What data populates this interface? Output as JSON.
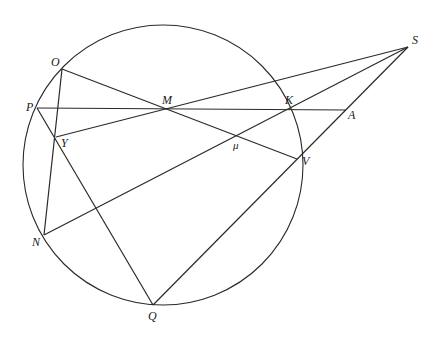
{
  "diagram": {
    "type": "geometry",
    "circle": {
      "cx": 163,
      "cy": 165,
      "r": 140
    },
    "points": {
      "O": [
        62,
        69
      ],
      "P": [
        37,
        108
      ],
      "M": [
        167,
        108
      ],
      "Y": [
        56,
        137
      ],
      "K": [
        287,
        110
      ],
      "A": [
        346,
        110
      ],
      "S": [
        408,
        47
      ],
      "mu": [
        238,
        135
      ],
      "V": [
        297,
        159
      ],
      "N": [
        44,
        235
      ],
      "Q": [
        153,
        305
      ]
    },
    "segments": [
      [
        "O",
        "V"
      ],
      [
        "O",
        "N"
      ],
      [
        "P",
        "A"
      ],
      [
        "P",
        "Q"
      ],
      [
        "Y",
        "S"
      ],
      [
        "N",
        "S"
      ],
      [
        "Q",
        "S"
      ]
    ],
    "labels": {
      "O": "O",
      "P": "P",
      "M": "M",
      "Y": "Y",
      "K": "K",
      "A": "A",
      "S": "S",
      "mu": "μ",
      "V": "V",
      "N": "N",
      "Q": "Q"
    },
    "stroke_color": "#2a2a2a"
  }
}
